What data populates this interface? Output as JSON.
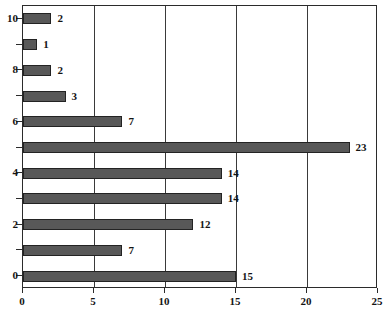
{
  "chart_data": {
    "type": "bar",
    "orientation": "horizontal",
    "title": "",
    "xlabel": "",
    "ylabel": "",
    "categories": [
      "0",
      "1",
      "2",
      "3",
      "4",
      "5",
      "6",
      "7",
      "8",
      "9",
      "10"
    ],
    "values": [
      15,
      7,
      12,
      14,
      14,
      23,
      7,
      3,
      2,
      1,
      2
    ],
    "data_labels": [
      "15",
      "7",
      "12",
      "14",
      "14",
      "23",
      "7",
      "3",
      "2",
      "1",
      "2"
    ],
    "xlim": [
      0,
      25
    ],
    "ylim": [
      -0.5,
      10.5
    ],
    "x_ticks": [
      0,
      5,
      10,
      15,
      20,
      25
    ],
    "x_tick_labels": [
      "0",
      "5",
      "10",
      "15",
      "20",
      "25"
    ],
    "y_ticks": [
      0,
      1,
      2,
      3,
      4,
      5,
      6,
      7,
      8,
      9,
      10
    ],
    "y_tick_labels": [
      "0",
      "",
      "2",
      "",
      "4",
      "",
      "6",
      "",
      "8",
      "",
      "10"
    ],
    "y_labeled_ticks": [
      0,
      2,
      4,
      6,
      8,
      10
    ],
    "grid": "vertical",
    "legend": "none",
    "bar_color": "#585858",
    "bar_edge_color": "#232323",
    "gridline_color": "#3a3a3a",
    "axis_color": "#2b2b2b",
    "background_color": "#ffffff"
  },
  "edges": {
    "title_fragment": "",
    "caption_fragment": ""
  }
}
